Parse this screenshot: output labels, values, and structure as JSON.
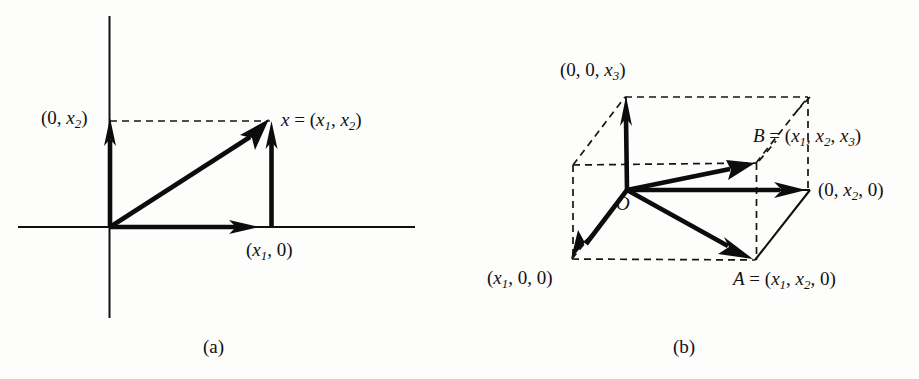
{
  "figure": {
    "background_color": "#fdfdfc",
    "ink_color": "#101010",
    "panels": [
      {
        "id": "a",
        "caption": "(a)",
        "description": "Two-dimensional vector decomposition on rectangular axes",
        "labels": {
          "y_component": "(0, x2)",
          "x_component": "(x1, 0)",
          "vector_point": "x = (x1, x2)"
        }
      },
      {
        "id": "b",
        "caption": "(b)",
        "description": "Three-dimensional vector decomposition inside a rectangular box",
        "labels": {
          "z_component": "(0, 0, x3)",
          "x_component": "(x1, 0, 0)",
          "y_component": "(0, x2, 0)",
          "point_a": "A = (x1, x2, 0)",
          "point_b": "B = (x1, x2, x3)",
          "origin": "O"
        }
      }
    ]
  },
  "labels_2d": {
    "y_axis_point_prefix": "(0, ",
    "y_axis_point_var": "x",
    "y_axis_point_sub": "2",
    "y_axis_point_suffix": ")",
    "x_axis_point_prefix": "(",
    "x_axis_point_var": "x",
    "x_axis_point_sub": "1",
    "x_axis_point_suffix": ", 0)",
    "vector_prefix": "x",
    "vector_eq": " = (",
    "vector_v1": "x",
    "vector_v1_sub": "1",
    "vector_comma": ", ",
    "vector_v2": "x",
    "vector_v2_sub": "2",
    "vector_suffix": ")"
  },
  "labels_3d": {
    "z_prefix": "(0, 0, ",
    "z_var": "x",
    "z_sub": "3",
    "z_suffix": ")",
    "x_prefix": "(",
    "x_var": "x",
    "x_sub": "1",
    "x_suffix": ", 0, 0)",
    "y_prefix": "(0, ",
    "y_var": "x",
    "y_sub": "2",
    "y_suffix": ", 0)",
    "a_name": "A",
    "a_eq": " = (",
    "a_v1": "x",
    "a_v1_sub": "1",
    "a_comma": ", ",
    "a_v2": "x",
    "a_v2_sub": "2",
    "a_suffix": ", 0)",
    "b_name": "B",
    "b_eq": " = (",
    "b_v1": "x",
    "b_v1_sub": "1",
    "b_comma1": ", ",
    "b_v2": "x",
    "b_v2_sub": "2",
    "b_comma2": ", ",
    "b_v3": "x",
    "b_v3_sub": "3",
    "b_suffix": ")",
    "origin": "O"
  },
  "captions": {
    "panel_a": "(a)",
    "panel_b": "(b)"
  },
  "geometry_2d": {
    "origin": [
      110,
      227
    ],
    "x_axis_span": [
      18,
      415
    ],
    "y_axis_span": [
      16,
      318
    ],
    "x1_x": 272,
    "x2_y": 122,
    "x_arrow_tip": [
      252,
      227
    ],
    "y_arrow_tip": [
      110,
      124
    ],
    "vertical_arrow_tip": [
      272,
      126
    ],
    "diagonal_arrow_tip": [
      268,
      124
    ]
  },
  "geometry_3d": {
    "origin": [
      627,
      190
    ],
    "front_bottom_left": [
      572,
      259
    ],
    "front_bottom_right": [
      755,
      260
    ],
    "right_mid": [
      810,
      190
    ],
    "back_top_left": [
      625,
      97
    ],
    "back_top_right": [
      808,
      97
    ],
    "back_mid_left": [
      573,
      165
    ],
    "point_b": [
      757,
      163
    ]
  }
}
